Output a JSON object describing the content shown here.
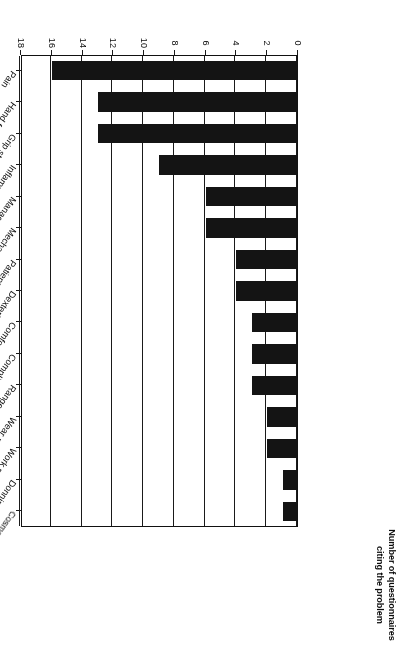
{
  "chart_data": {
    "type": "bar",
    "orientation": "horizontal",
    "title": "",
    "subtitle": "",
    "xlabel": "Number of questionnaires citing the problem",
    "ylabel": "",
    "categories": [
      "Pain",
      "Hand function",
      "Grip strength",
      "Inflammation",
      "Management",
      "Mechanical alignment",
      "Patient satisfaction",
      "Dexterity",
      "Comfort",
      "Compliance",
      "Range of movement",
      "Wear resistance",
      "Work performance",
      "Donning and doffing",
      "Cosmetic acceptability"
    ],
    "values": [
      16,
      13,
      13,
      9,
      6,
      6,
      4,
      4,
      3,
      3,
      3,
      2,
      2,
      1,
      1
    ],
    "xlim": [
      0,
      18
    ],
    "ylim": [
      0,
      15
    ],
    "tick_labels": [
      "0",
      "2",
      "4",
      "6",
      "8",
      "10",
      "12",
      "14",
      "16",
      "18"
    ],
    "tick_values": [
      0,
      2,
      4,
      6,
      8,
      10,
      12,
      14,
      16,
      18
    ],
    "grid": true,
    "grid_axis": "x",
    "legend": false,
    "legend_position": "none",
    "bar_color": "#141414",
    "background_color": "#ffffff",
    "axis_color": "#1a1a1a",
    "rotation_degrees": 180
  },
  "axis_title": {
    "line1": "Number of questionnaires",
    "line2": "citing the problem"
  }
}
